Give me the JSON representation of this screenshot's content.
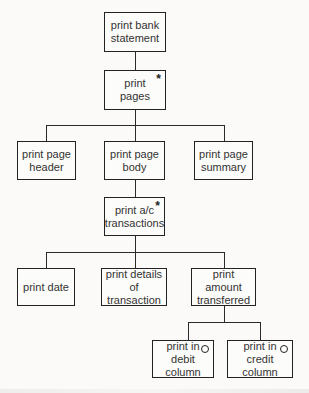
{
  "diagram": {
    "type": "Jackson structure diagram",
    "background": "#fbfaf8",
    "line_color": "#2a2a2a",
    "markers": {
      "iteration": "*",
      "selection": "o"
    },
    "nodes": {
      "root": {
        "label": "print bank\nstatement",
        "marker": ""
      },
      "pages": {
        "label": "print\npages",
        "marker": "*"
      },
      "header": {
        "label": "print page\nheader",
        "marker": ""
      },
      "body": {
        "label": "print page\nbody",
        "marker": ""
      },
      "summary": {
        "label": "print page\nsummary",
        "marker": ""
      },
      "transactions": {
        "label": "print a/c\ntransactions",
        "marker": "*"
      },
      "date": {
        "label": "print date",
        "marker": ""
      },
      "details": {
        "label": "print details\nof transaction",
        "marker": ""
      },
      "amount": {
        "label": "print amount\ntransferred",
        "marker": ""
      },
      "debit": {
        "label": "print in\ndebit column",
        "marker": "o"
      },
      "credit": {
        "label": "print in\ncredit column",
        "marker": "o"
      }
    },
    "edges": [
      [
        "root",
        "pages"
      ],
      [
        "pages",
        "header"
      ],
      [
        "pages",
        "body"
      ],
      [
        "pages",
        "summary"
      ],
      [
        "body",
        "transactions"
      ],
      [
        "transactions",
        "date"
      ],
      [
        "transactions",
        "details"
      ],
      [
        "transactions",
        "amount"
      ],
      [
        "amount",
        "debit"
      ],
      [
        "amount",
        "credit"
      ]
    ]
  }
}
